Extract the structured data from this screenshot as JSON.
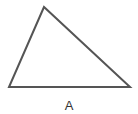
{
  "diagram": {
    "shape": "triangle",
    "vertices": [
      [
        44,
        7
      ],
      [
        9,
        87
      ],
      [
        130,
        87
      ]
    ],
    "stroke_color": "#555555",
    "stroke_width": 2,
    "fill": "#ffffff",
    "label": "A"
  }
}
